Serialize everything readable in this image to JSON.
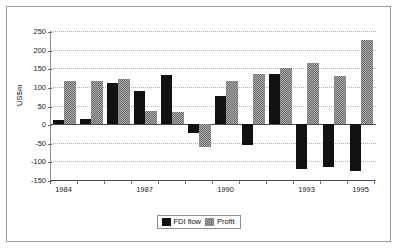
{
  "chart_data": {
    "type": "bar",
    "title": "",
    "subtitle": "",
    "xlabel": "",
    "ylabel": "US$m",
    "ylim": [
      -150,
      250
    ],
    "ytick_values": [
      250,
      200,
      150,
      100,
      50,
      0,
      -50,
      -100,
      -150
    ],
    "ytick_labels": [
      "250",
      "200",
      "150",
      "100",
      "50",
      "0",
      "-50",
      "-100",
      "-150"
    ],
    "grid": true,
    "legend_position": "bottom-center",
    "categories": [
      "1984",
      "1985",
      "1986",
      "1987",
      "1988",
      "1989",
      "1990",
      "1991",
      "1992",
      "1993",
      "1994",
      "1995"
    ],
    "xtick_labels": [
      "1984",
      "1987",
      "1990",
      "1993",
      "1995"
    ],
    "xtick_label_categories": [
      "1984",
      "1987",
      "1990",
      "1993",
      "1995"
    ],
    "series": [
      {
        "name": "FDI flow",
        "color": "#111111",
        "values": [
          10,
          15,
          110,
          90,
          132,
          -25,
          75,
          -55,
          135,
          -120,
          -115,
          -125
        ]
      },
      {
        "name": "Profit",
        "color": "#8a8a8a",
        "values": [
          115,
          115,
          120,
          35,
          33,
          -62,
          115,
          135,
          152,
          165,
          130,
          225
        ]
      }
    ]
  },
  "legend": {
    "entries": [
      {
        "label": "FDI flow"
      },
      {
        "label": "Profit"
      }
    ]
  },
  "axes": {
    "y_title": "US$m"
  }
}
